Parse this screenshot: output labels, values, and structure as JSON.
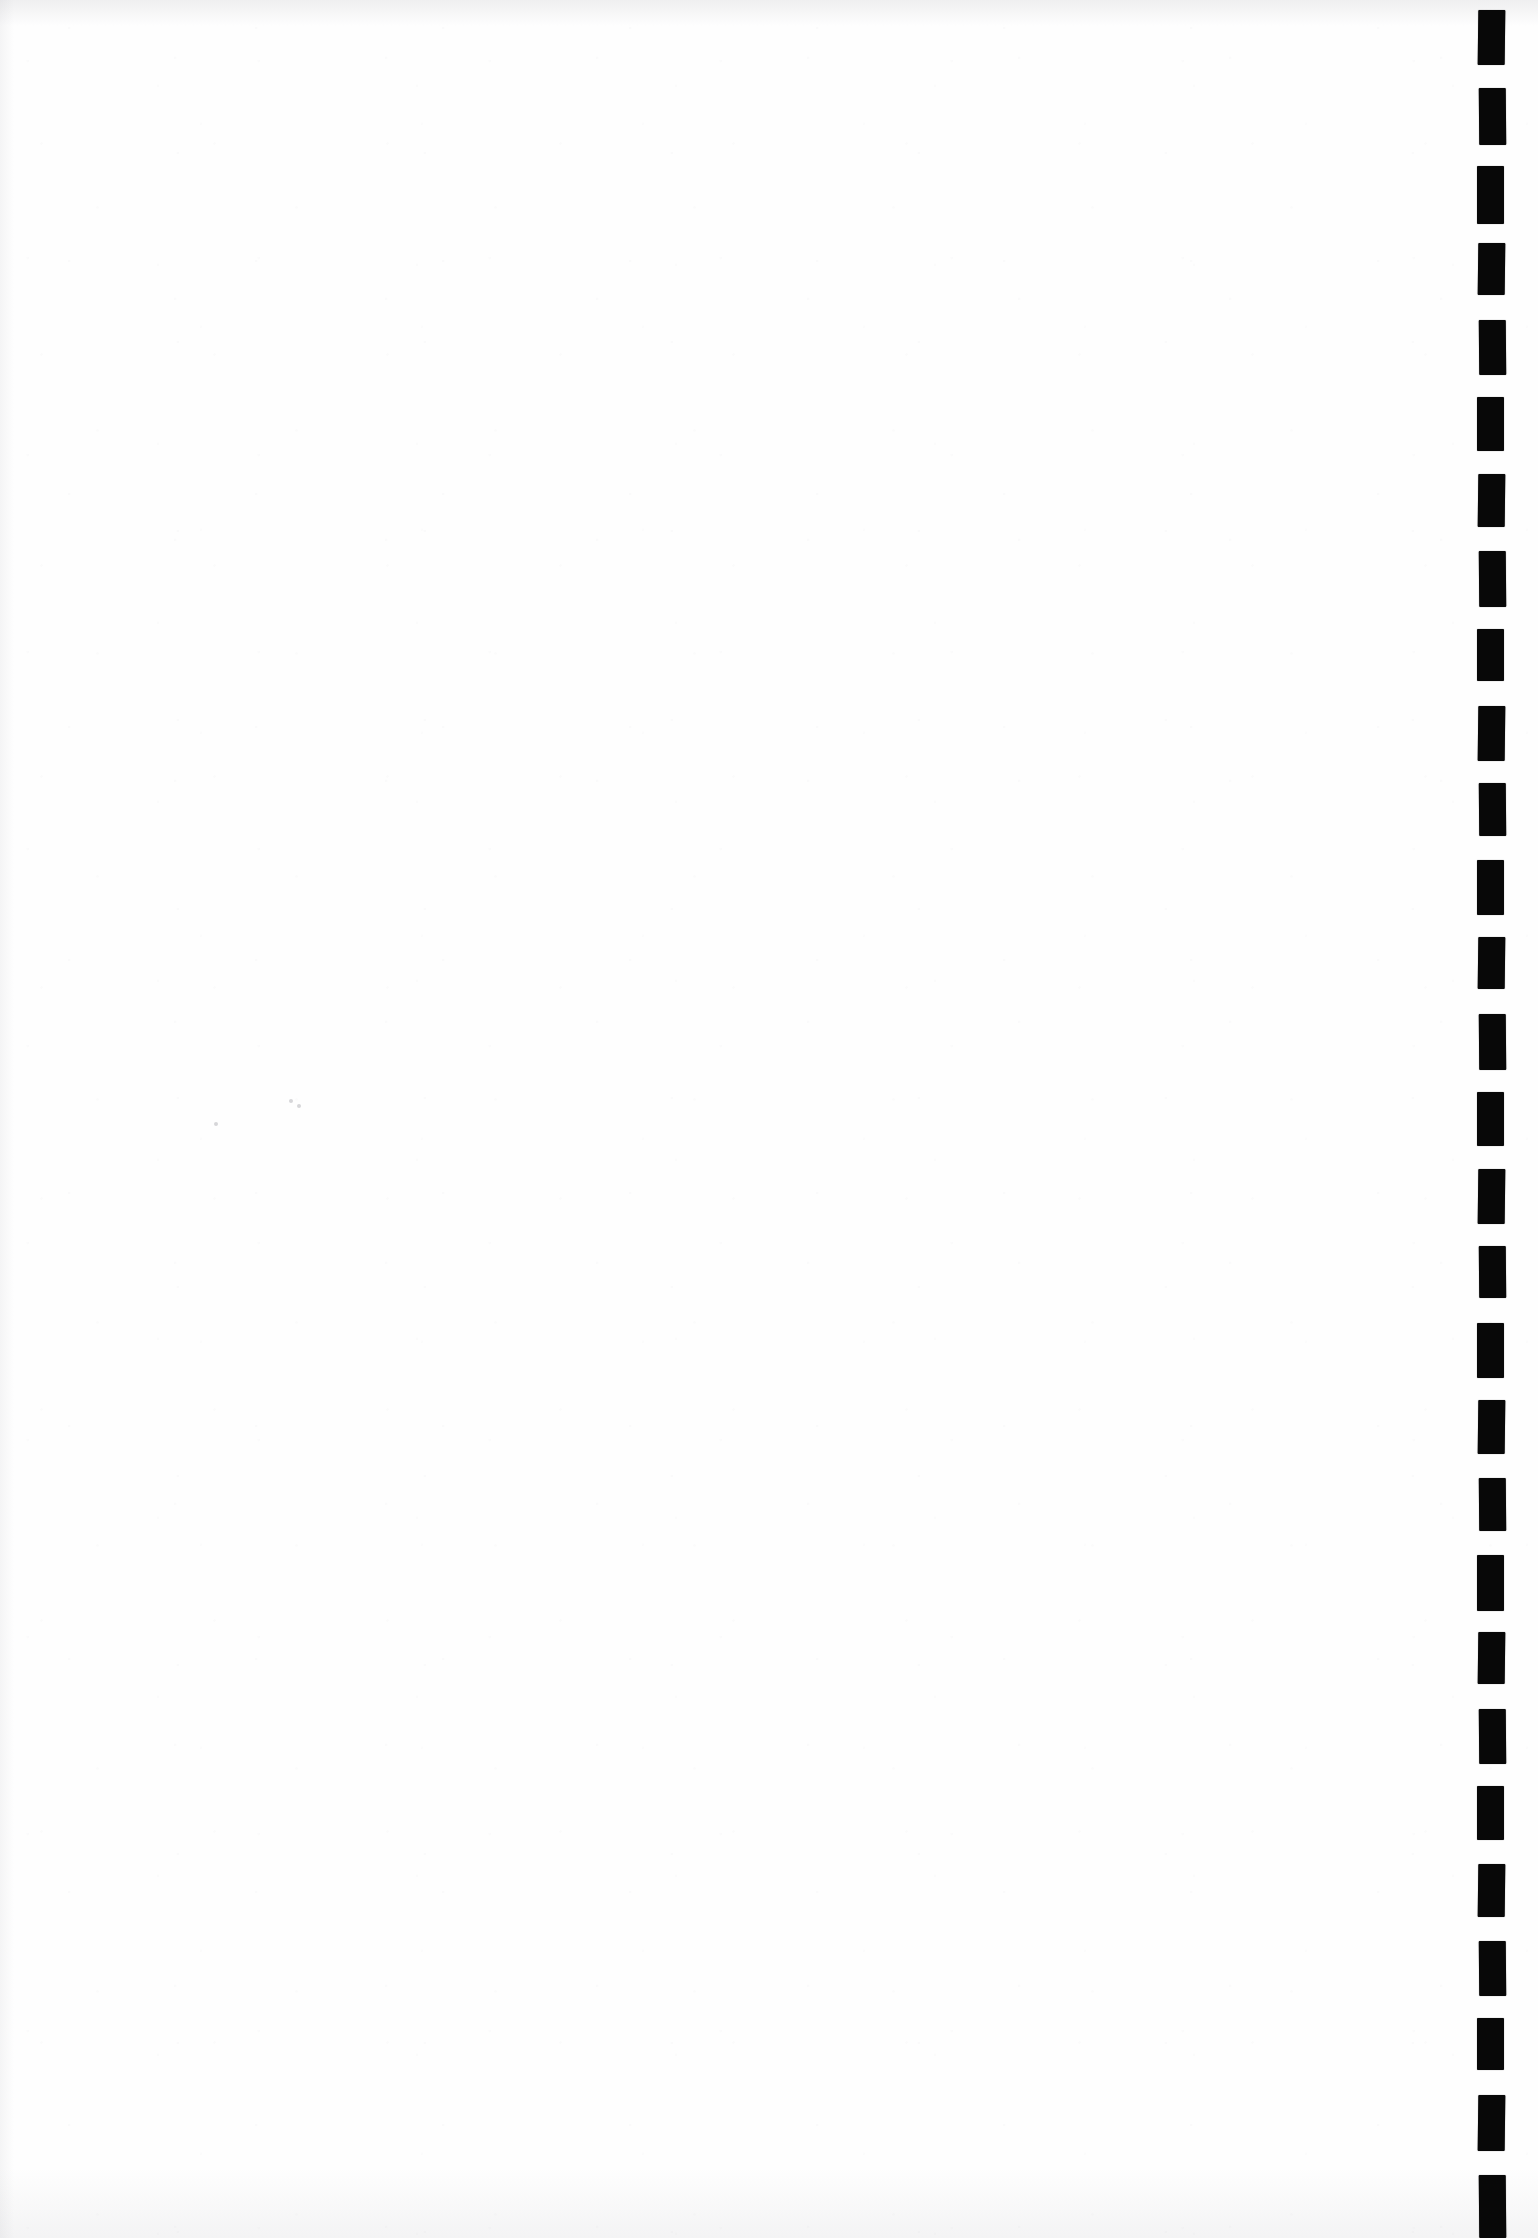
{
  "page": {
    "kind": "blank-scanned-document-page",
    "width": 1538,
    "height": 2238,
    "background_color": "#ffffff",
    "paper_color": "#fefefe",
    "body_text": "",
    "visible_text": "",
    "note": "Page body contains no printed text or graphics."
  },
  "registration_marks": {
    "label": "registration-mark-column",
    "count": 29,
    "color": "#080808",
    "column_left": 1472,
    "mark_left_offset": 6,
    "mark_width": 27,
    "pitch": 77,
    "first_mark_top": 10,
    "marks": [
      {
        "top": 10,
        "height": 55
      },
      {
        "top": 88,
        "height": 57
      },
      {
        "top": 166,
        "height": 58
      },
      {
        "top": 243,
        "height": 52
      },
      {
        "top": 320,
        "height": 55
      },
      {
        "top": 397,
        "height": 54
      },
      {
        "top": 474,
        "height": 53
      },
      {
        "top": 551,
        "height": 56
      },
      {
        "top": 629,
        "height": 52
      },
      {
        "top": 706,
        "height": 55
      },
      {
        "top": 783,
        "height": 53
      },
      {
        "top": 860,
        "height": 55
      },
      {
        "top": 937,
        "height": 52
      },
      {
        "top": 1014,
        "height": 56
      },
      {
        "top": 1092,
        "height": 54
      },
      {
        "top": 1169,
        "height": 55
      },
      {
        "top": 1246,
        "height": 52
      },
      {
        "top": 1323,
        "height": 55
      },
      {
        "top": 1400,
        "height": 54
      },
      {
        "top": 1478,
        "height": 53
      },
      {
        "top": 1555,
        "height": 56
      },
      {
        "top": 1632,
        "height": 52
      },
      {
        "top": 1709,
        "height": 55
      },
      {
        "top": 1786,
        "height": 54
      },
      {
        "top": 1864,
        "height": 53
      },
      {
        "top": 1941,
        "height": 55
      },
      {
        "top": 2018,
        "height": 52
      },
      {
        "top": 2095,
        "height": 56
      },
      {
        "top": 2175,
        "height": 63
      }
    ]
  },
  "artifacts": {
    "specks": [
      {
        "left": 289,
        "top": 1099
      },
      {
        "left": 297,
        "top": 1104
      },
      {
        "left": 214,
        "top": 1122
      }
    ]
  }
}
